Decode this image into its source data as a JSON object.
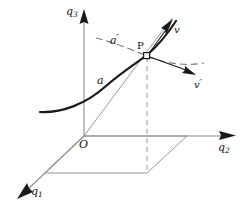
{
  "figure": {
    "background_color": "#ffffff",
    "axis_color": "#8c8c8c",
    "curve_color": "#1a1a1a",
    "dash_color": "#8c8c8c",
    "label_color": "#111111"
  },
  "axes": {
    "vertical": {
      "name": "q3",
      "base": "q",
      "subscript": "3"
    },
    "right": {
      "name": "q2",
      "base": "q",
      "subscript": "2"
    },
    "depth": {
      "name": "q1",
      "base": "q",
      "subscript": "1"
    },
    "origin": {
      "label": "O"
    }
  },
  "points": {
    "p": {
      "label": "P",
      "marker": "open-square"
    }
  },
  "curves": {
    "solid_curve": {
      "label": "a",
      "base": "a",
      "prime": ""
    },
    "dashed_curve": {
      "label": "a'",
      "base": "a",
      "prime": "′"
    }
  },
  "vectors": {
    "v": {
      "label": "v",
      "base": "v",
      "prime": "",
      "direction": "up-right"
    },
    "v_prime": {
      "label": "v'",
      "base": "v",
      "prime": "′",
      "direction": "down-right"
    }
  },
  "icons": {
    "arrow_head": "arrowhead-icon",
    "point_marker": "square-point-icon"
  }
}
